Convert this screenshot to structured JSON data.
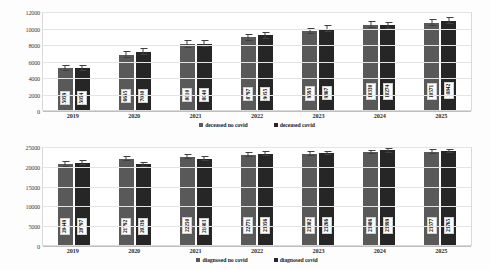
{
  "chart_data": [
    {
      "type": "bar",
      "title": "",
      "xlabel": "",
      "ylabel": "",
      "categories": [
        "2019",
        "2020",
        "2021",
        "2022",
        "2023",
        "2024",
        "2025"
      ],
      "ylim": [
        0,
        12000
      ],
      "yticks": [
        "0",
        "2000",
        "4000",
        "6000",
        "8000",
        "10000",
        "12000"
      ],
      "grid": true,
      "legend_position": "bottom",
      "series": [
        {
          "name": "deceased no covid",
          "color": "#595959",
          "values": [
            5059,
            6695,
            8010,
            8797,
            9595,
            10330,
            10571
          ],
          "errors": [
            700,
            800,
            900,
            850,
            750,
            800,
            850
          ]
        },
        {
          "name": "deceased covid",
          "color": "#262626",
          "values": [
            5054,
            7080,
            8040,
            9055,
            9867,
            10274,
            10842
          ],
          "errors": [
            750,
            850,
            900,
            900,
            800,
            850,
            900
          ]
        }
      ]
    },
    {
      "type": "bar",
      "title": "",
      "xlabel": "",
      "ylabel": "",
      "categories": [
        "2019",
        "2020",
        "2021",
        "2022",
        "2023",
        "2024",
        "2025"
      ],
      "ylim": [
        0,
        25000
      ],
      "yticks": [
        "0",
        "5000",
        "10000",
        "15000",
        "20000",
        "25000"
      ],
      "grid": true,
      "legend_position": "bottom",
      "series": [
        {
          "name": "diagnosed no covid",
          "color": "#595959",
          "values": [
            20449,
            21792,
            22250,
            22771,
            23082,
            23486,
            23577
          ],
          "errors": [
            1500,
            1400,
            1300,
            1200,
            1200,
            1200,
            1200
          ]
        },
        {
          "name": "diagnosed covid",
          "color": "#262626",
          "values": [
            20797,
            20336,
            21803,
            23056,
            23266,
            23899,
            23765
          ],
          "errors": [
            1400,
            1300,
            1200,
            1200,
            1200,
            1200,
            1200
          ]
        }
      ]
    }
  ]
}
